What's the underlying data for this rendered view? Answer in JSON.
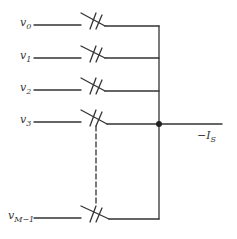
{
  "diagram": {
    "type": "switch-array-summing-circuit",
    "stroke_color": "#333333",
    "inputs": [
      {
        "var": "v",
        "sub": "0",
        "y": 25
      },
      {
        "var": "v",
        "sub": "1",
        "y": 58
      },
      {
        "var": "v",
        "sub": "2",
        "y": 90
      },
      {
        "var": "v",
        "sub": "3",
        "y": 122
      },
      {
        "var": "v",
        "sub": "M−1",
        "y": 218
      }
    ],
    "output": {
      "label_main": "−I",
      "label_sub": "S"
    },
    "ellipsis": "dashed mechanical linkage between v3 and vM−1 switches"
  }
}
